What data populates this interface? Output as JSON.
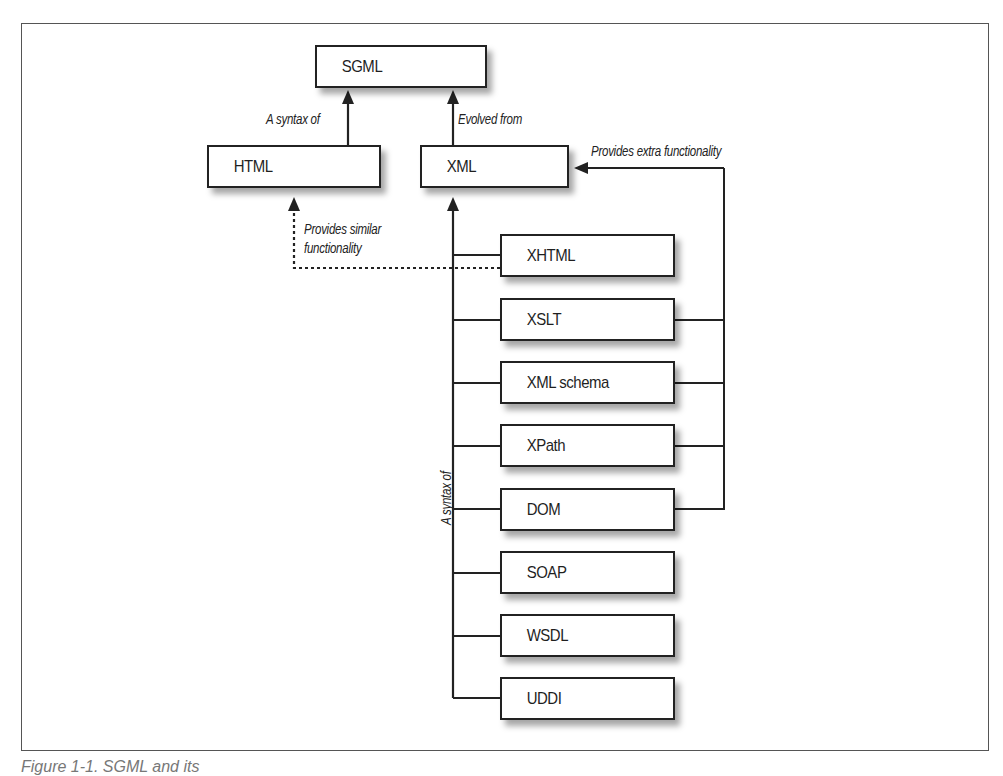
{
  "diagram": {
    "nodes": {
      "sgml": "SGML",
      "html": "HTML",
      "xml": "XML",
      "xhtml": "XHTML",
      "xslt": "XSLT",
      "xml_schema": "XML schema",
      "xpath": "XPath",
      "dom": "DOM",
      "soap": "SOAP",
      "wsdl": "WSDL",
      "uddi": "UDDI"
    },
    "edge_labels": {
      "html_to_sgml": "A syntax of",
      "xml_to_sgml": "Evolved from",
      "tools_to_xml": "Provides extra functionality",
      "xhtml_to_html_line1": "Provides similar",
      "xhtml_to_html_line2": "functionality",
      "children_to_xml": "A syntax of"
    },
    "edges": [
      {
        "from": "HTML",
        "to": "SGML",
        "label": "A syntax of",
        "style": "solid"
      },
      {
        "from": "XML",
        "to": "SGML",
        "label": "Evolved from",
        "style": "solid"
      },
      {
        "from": "XHTML",
        "to": "HTML",
        "label": "Provides similar functionality",
        "style": "dotted"
      },
      {
        "from": [
          "XHTML",
          "XSLT",
          "XML schema",
          "XPath",
          "DOM",
          "SOAP",
          "WSDL",
          "UDDI"
        ],
        "to": "XML",
        "label": "A syntax of",
        "style": "solid"
      },
      {
        "from": [
          "XSLT",
          "XML schema",
          "XPath",
          "DOM"
        ],
        "to": "XML",
        "label": "Provides extra functionality",
        "style": "solid"
      }
    ]
  },
  "caption": "Figure 1-1. SGML and its"
}
